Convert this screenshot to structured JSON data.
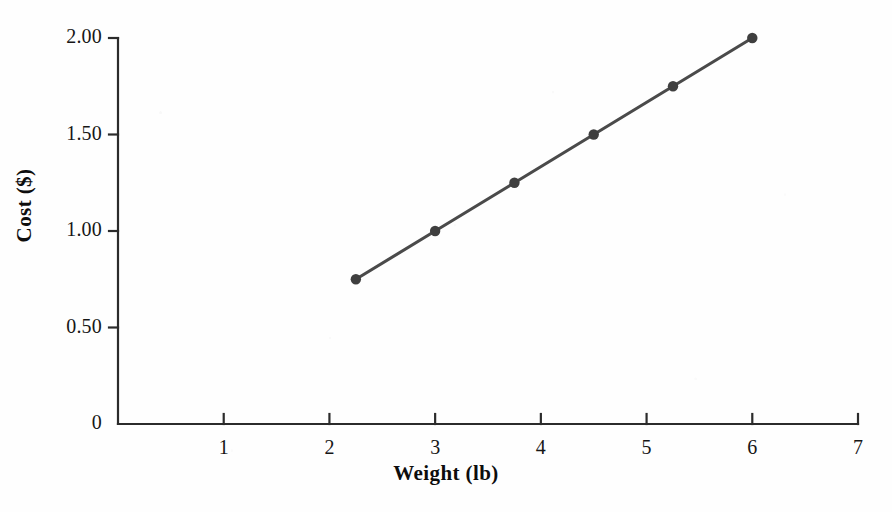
{
  "chart_data": {
    "type": "line",
    "title": "",
    "xlabel": "Weight (lb)",
    "ylabel": "Cost ($)",
    "xlim": [
      0,
      7
    ],
    "ylim": [
      0,
      2.0
    ],
    "grid": false,
    "legend": null,
    "x_ticks": [
      "1",
      "2",
      "3",
      "4",
      "5",
      "6",
      "7"
    ],
    "x_tick_values": [
      1,
      2,
      3,
      4,
      5,
      6,
      7
    ],
    "y_ticks": [
      "0",
      "0.50",
      "1.00",
      "1.50",
      "2.00"
    ],
    "y_tick_values": [
      0,
      0.5,
      1.0,
      1.5,
      2.0
    ],
    "x": [
      2.25,
      3.0,
      3.75,
      4.5,
      5.25,
      6.0
    ],
    "values": [
      0.75,
      1.0,
      1.25,
      1.5,
      1.75,
      2.0
    ],
    "series": [
      {
        "name": "Cost vs Weight",
        "x": [
          2.25,
          3.0,
          3.75,
          4.5,
          5.25,
          6.0
        ],
        "values": [
          0.75,
          1.0,
          1.25,
          1.5,
          1.75,
          2.0
        ]
      }
    ],
    "marker": "circle",
    "line_color": "#4a4a4a",
    "marker_color": "#3f3f3f",
    "axis_color": "#2b2b2b",
    "background_color": "#fefefe"
  },
  "axis": {
    "x_title": "Weight (lb)",
    "y_title": "Cost ($)"
  }
}
